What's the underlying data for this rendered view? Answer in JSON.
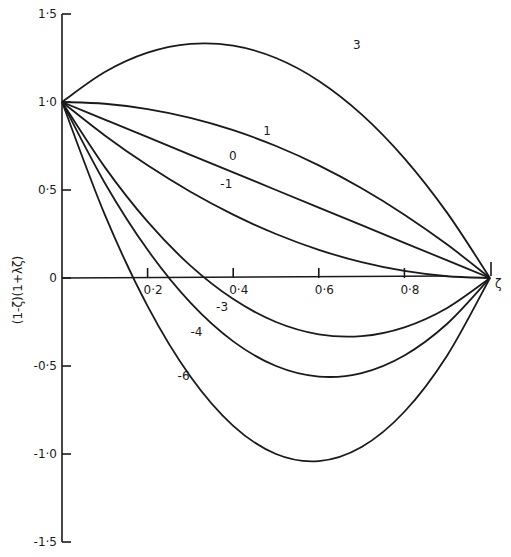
{
  "chart_data": {
    "type": "line",
    "title": "",
    "xlabel": "ζ",
    "ylabel": "(1-ζ)(1+λζ)",
    "xlim": [
      0,
      1.0
    ],
    "ylim": [
      -1.5,
      1.5
    ],
    "grid": false,
    "legend": "inline curve labels",
    "x_ticks": [
      "0·2",
      "0·4",
      "0·6",
      "0·8"
    ],
    "x_tick_values": [
      0.2,
      0.4,
      0.6,
      0.8
    ],
    "y_ticks": [
      "1·5",
      "1·0",
      "0·5",
      "0",
      "-0·5",
      "-1·0",
      "-1·5"
    ],
    "y_tick_values": [
      1.5,
      1.0,
      0.5,
      0,
      -0.5,
      -1.0,
      -1.5
    ],
    "x": [
      0,
      0.1,
      0.2,
      0.3,
      0.4,
      0.5,
      0.6,
      0.7,
      0.8,
      0.9,
      1.0
    ],
    "series": [
      {
        "name": "3",
        "values": [
          1,
          1.17,
          1.28,
          1.33,
          1.32,
          1.25,
          1.12,
          0.93,
          0.68,
          0.37,
          0
        ],
        "label_pos": [
          0.68,
          1.3
        ]
      },
      {
        "name": "1",
        "values": [
          1,
          0.99,
          0.96,
          0.91,
          0.84,
          0.75,
          0.64,
          0.51,
          0.36,
          0.19,
          0
        ],
        "label_pos": [
          0.47,
          0.81
        ]
      },
      {
        "name": "0",
        "values": [
          1,
          0.9,
          0.8,
          0.7,
          0.6,
          0.5,
          0.4,
          0.3,
          0.2,
          0.1,
          0
        ],
        "label_pos": [
          0.39,
          0.67
        ]
      },
      {
        "name": "-1",
        "values": [
          1,
          0.81,
          0.64,
          0.49,
          0.36,
          0.25,
          0.16,
          0.09,
          0.04,
          0.01,
          0
        ],
        "label_pos": [
          0.37,
          0.51
        ]
      },
      {
        "name": "-3",
        "values": [
          1,
          0.63,
          0.32,
          0.07,
          -0.12,
          -0.25,
          -0.32,
          -0.33,
          -0.28,
          -0.17,
          0
        ],
        "label_pos": [
          0.36,
          -0.19
        ]
      },
      {
        "name": "-4",
        "values": [
          1,
          0.54,
          0.16,
          -0.14,
          -0.36,
          -0.5,
          -0.56,
          -0.54,
          -0.44,
          -0.26,
          0
        ],
        "label_pos": [
          0.3,
          -0.33
        ]
      },
      {
        "name": "-6",
        "values": [
          1,
          0.36,
          -0.16,
          -0.56,
          -0.84,
          -1.0,
          -1.04,
          -0.96,
          -0.76,
          -0.44,
          0
        ],
        "label_pos": [
          0.27,
          -0.58
        ]
      }
    ]
  }
}
